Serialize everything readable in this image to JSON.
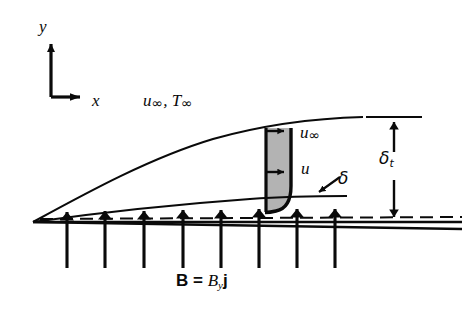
{
  "figure": {
    "kind": "mhd-boundary-layer-flat-plate-diagram",
    "background_color": "#ffffff",
    "ink_color": "#0a0a0a",
    "shading_color": "#b3b3b3"
  },
  "axes": {
    "y_axis_label": "y",
    "x_axis_label": "x",
    "origin": {
      "x": 51,
      "y": 97
    },
    "y_arrow_tip": {
      "x": 51,
      "y": 36
    },
    "x_arrow_tip": {
      "x": 89,
      "y": 97
    }
  },
  "labels": {
    "freestream": {
      "u": "u",
      "u_sub": "∞",
      "sep": ", ",
      "T": "T",
      "T_sub": "∞"
    },
    "profile_top_velocity": {
      "sym": "u",
      "sub": "∞"
    },
    "profile_local_velocity": {
      "sym": "u"
    },
    "velocity_boundary_layer": {
      "sym": "δ"
    },
    "thermal_boundary_layer": {
      "sym": "δ",
      "sub": "t"
    },
    "magnetic_field": {
      "vector": "B",
      "equals": " = ",
      "component": "B",
      "component_sub": "y",
      "unit_vector": "j"
    }
  },
  "plate": {
    "leading_edge": {
      "x": 33,
      "y": 222
    },
    "trailing_x": 462,
    "top_surface_y": 222,
    "bottom_surface_y": 229,
    "centerline_y": 218,
    "centerline_style": "dashed"
  },
  "boundary_layers": {
    "thermal": {
      "label": "δt",
      "start": {
        "x": 33,
        "y": 222
      },
      "end": {
        "x": 363,
        "y": 117
      },
      "shape": "parabolic-growth"
    },
    "velocity": {
      "label": "δ",
      "start": {
        "x": 33,
        "y": 222
      },
      "end": {
        "x": 347,
        "y": 196
      },
      "shape": "near-linear-growth"
    }
  },
  "velocity_profile": {
    "station_x": 266,
    "top_y": 128,
    "wall_y": 213,
    "free_stream_x": 291,
    "shaded": true,
    "arrows": [
      {
        "name": "free-stream-arrow",
        "y": 131,
        "x_from": 266,
        "x_to": 291
      },
      {
        "name": "local-velocity-arrow",
        "y": 172,
        "x_from": 266,
        "x_to": 291
      }
    ]
  },
  "magnetic_field_arrows": {
    "count": 8,
    "x_positions": [
      67,
      105,
      144,
      183,
      221,
      259,
      297,
      335
    ],
    "tail_y": 268,
    "head_y": 200,
    "direction": "up"
  },
  "dimension": {
    "name": "delta-t-dimension",
    "x": 394,
    "top_y": 118,
    "bottom_y": 222,
    "top_tick": {
      "x_from": 366,
      "x_to": 422,
      "y": 117
    },
    "double_headed": true
  }
}
